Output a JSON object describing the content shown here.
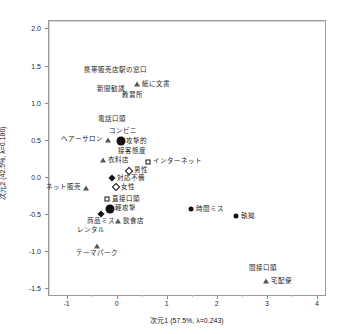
{
  "chart_data": {
    "type": "scatter",
    "title": "",
    "xlabel": "次元1 (57.5%, λ=0.243)",
    "ylabel": "次元2 (42.5%, λ=0.180)",
    "xlim": [
      -1.35,
      4.2
    ],
    "ylim": [
      -1.62,
      2.1
    ],
    "xticks": [
      -1,
      0,
      1,
      2,
      3,
      4
    ],
    "xticklabels": [
      "-1",
      "0",
      "1",
      "2",
      "3",
      "4"
    ],
    "yticks": [
      2.0,
      1.5,
      1.0,
      0.5,
      0.0,
      -0.5,
      -1.0,
      -1.5
    ],
    "yticklabels": [
      "2.0",
      "1.5",
      "1.0",
      "0.5",
      "0.0",
      "-0.5",
      "-1.0",
      "-1.5"
    ],
    "grid": false,
    "reference_lines": {
      "x": 0,
      "y": 0
    },
    "legend": "none",
    "points": [
      {
        "label": "携帯販売店",
        "x": -0.3,
        "y": 1.38,
        "marker": "none",
        "label_pos": "mid-above"
      },
      {
        "label": "駅の窓口",
        "x": 0.33,
        "y": 1.38,
        "marker": "none",
        "label_pos": "mid-above"
      },
      {
        "label": "紙に文書",
        "x": 0.4,
        "y": 1.25,
        "marker": "tri-open",
        "label_pos": "right"
      },
      {
        "label": "新聞勧誘",
        "x": -0.12,
        "y": 1.13,
        "marker": "none",
        "label_pos": "mid-above"
      },
      {
        "label": "教習所",
        "x": 0.32,
        "y": 1.05,
        "marker": "none",
        "label_pos": "mid-above"
      },
      {
        "label": "電話口頭",
        "x": -0.1,
        "y": 0.72,
        "marker": "none",
        "label_pos": "mid-above"
      },
      {
        "label": "コンビニ",
        "x": 0.12,
        "y": 0.57,
        "marker": "none",
        "label_pos": "mid-above"
      },
      {
        "label": "ヘアーサロン",
        "x": -0.18,
        "y": 0.5,
        "marker": "tri-open",
        "label_pos": "left"
      },
      {
        "label": "攻撃的",
        "x": 0.08,
        "y": 0.48,
        "marker": "dot-lg",
        "label_pos": "right"
      },
      {
        "label": "接客態度",
        "x": 0.3,
        "y": 0.3,
        "marker": "none",
        "label_pos": "mid-above"
      },
      {
        "label": "衣料店",
        "x": -0.28,
        "y": 0.22,
        "marker": "tri-open",
        "label_pos": "right"
      },
      {
        "label": "インターネット",
        "x": 0.62,
        "y": 0.2,
        "marker": "square-open",
        "label_pos": "right"
      },
      {
        "label": "男性",
        "x": 0.25,
        "y": 0.08,
        "marker": "diamond-open",
        "label_pos": "right"
      },
      {
        "label": "対応不備",
        "x": -0.1,
        "y": -0.02,
        "marker": "diamond",
        "label_pos": "right"
      },
      {
        "label": "女性",
        "x": -0.02,
        "y": -0.14,
        "marker": "diamond-open",
        "label_pos": "right"
      },
      {
        "label": "ネット販売",
        "x": -0.62,
        "y": -0.15,
        "marker": "tri-open",
        "label_pos": "left"
      },
      {
        "label": "直接口頭",
        "x": -0.2,
        "y": -0.3,
        "marker": "square-open",
        "label_pos": "right"
      },
      {
        "label": "軽攻撃",
        "x": -0.14,
        "y": -0.43,
        "marker": "dot-lg",
        "label_pos": "right"
      },
      {
        "label": "商品ミス",
        "x": -0.32,
        "y": -0.5,
        "marker": "diamond",
        "label_pos": "mid-below"
      },
      {
        "label": "時間ミス",
        "x": 1.48,
        "y": -0.44,
        "marker": "dot-md",
        "label_pos": "right"
      },
      {
        "label": "飲食店",
        "x": 0.03,
        "y": -0.6,
        "marker": "tri-open",
        "label_pos": "right"
      },
      {
        "label": "執拗",
        "x": 2.38,
        "y": -0.53,
        "marker": "dot-md",
        "label_pos": "right"
      },
      {
        "label": "レンタル",
        "x": -0.52,
        "y": -0.77,
        "marker": "none",
        "label_pos": "mid-above"
      },
      {
        "label": "テーマパーク",
        "x": -0.4,
        "y": -0.93,
        "marker": "tri-open",
        "label_pos": "mid-below"
      },
      {
        "label": "間接口頭",
        "x": 2.92,
        "y": -1.28,
        "marker": "none",
        "label_pos": "mid-above"
      },
      {
        "label": "宅配便",
        "x": 2.98,
        "y": -1.41,
        "marker": "tri-open",
        "label_pos": "right"
      }
    ]
  },
  "colors": {
    "marker": "#111111",
    "frame": "#9a9a9a",
    "reference_line": "#d6d6d6",
    "text": "#1a1a1a",
    "background": "#ffffff"
  }
}
